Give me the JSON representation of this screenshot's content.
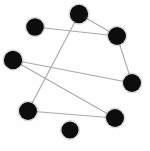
{
  "figure": {
    "title": "",
    "background_color": "#fefefe",
    "width": 150,
    "height": 151
  },
  "style": {
    "node_color": "#0d0d0d",
    "edge_color": "#a9a9a9",
    "node_radius": 8.8,
    "edge_width": 1.1
  },
  "chart_data": {
    "type": "scatter",
    "title": "",
    "subtitle": "",
    "xlabel": "",
    "ylabel": "",
    "grid": false,
    "legend": null,
    "axis_visible": false,
    "tick_labels": [],
    "annotations": [],
    "graph": {
      "kind": "node-link-diagram",
      "node_count": 9,
      "edge_count": 7,
      "directed": false,
      "nodes": [
        {
          "id": "n1",
          "label": "",
          "x": 35,
          "y": 27,
          "r": 8.8
        },
        {
          "id": "n2",
          "label": "",
          "x": 79,
          "y": 14,
          "r": 9.2
        },
        {
          "id": "n3",
          "label": "",
          "x": 117,
          "y": 36,
          "r": 9.0
        },
        {
          "id": "n4",
          "label": "",
          "x": 13,
          "y": 60,
          "r": 9.2
        },
        {
          "id": "n5",
          "label": "",
          "x": 132,
          "y": 83,
          "r": 9.0
        },
        {
          "id": "n6",
          "label": "",
          "x": 28,
          "y": 111,
          "r": 9.0
        },
        {
          "id": "n7",
          "label": "",
          "x": 115,
          "y": 118,
          "r": 9.0
        },
        {
          "id": "n8",
          "label": "",
          "x": 70,
          "y": 130,
          "r": 8.6
        },
        {
          "id": "n9",
          "label": "",
          "x": 61,
          "y": 92,
          "r": 0
        }
      ],
      "edges": [
        {
          "source": "n1",
          "target": "n3"
        },
        {
          "source": "n2",
          "target": "n6"
        },
        {
          "source": "n3",
          "target": "n5"
        },
        {
          "source": "n4",
          "target": "n5"
        },
        {
          "source": "n4",
          "target": "n7"
        },
        {
          "source": "n6",
          "target": "n7"
        },
        {
          "source": "n2",
          "target": "n3"
        }
      ],
      "isolated_nodes": [
        "n8"
      ],
      "x": [
        35,
        79,
        117,
        13,
        132,
        28,
        115,
        70
      ],
      "y": [
        27,
        14,
        36,
        60,
        83,
        111,
        118,
        130
      ]
    }
  }
}
